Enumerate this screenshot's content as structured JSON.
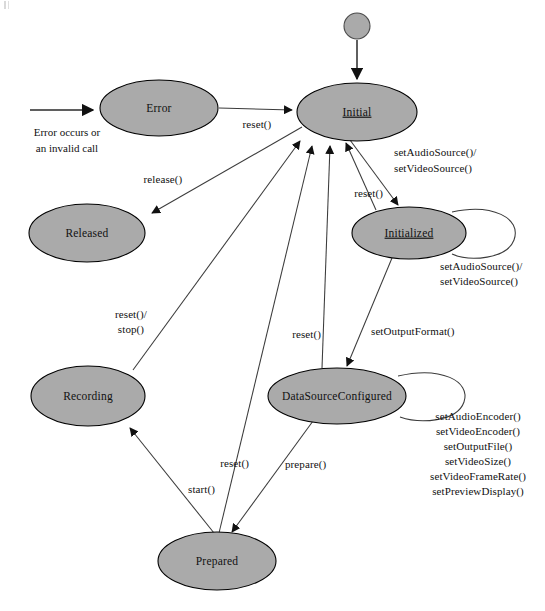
{
  "diagram": {
    "type": "state-machine",
    "colors": {
      "state_fill": "#aaaaaa",
      "state_stroke": "#000000",
      "edge_stroke": "#3b3b3b",
      "background": "#ffffff",
      "text": "#111111"
    },
    "start_node": {
      "name": "initial-pseudostate",
      "cx": 357,
      "cy": 26,
      "r": 13
    },
    "states": [
      {
        "id": "error",
        "label": "Error",
        "cx": 159,
        "cy": 108,
        "rx": 59,
        "ry": 28,
        "underlined": false
      },
      {
        "id": "initial",
        "label": "Initial",
        "cx": 357,
        "cy": 112,
        "rx": 60,
        "ry": 29,
        "underlined": true
      },
      {
        "id": "released",
        "label": "Released",
        "cx": 87,
        "cy": 233,
        "rx": 58,
        "ry": 29,
        "underlined": false
      },
      {
        "id": "initialized",
        "label": "Initialized",
        "cx": 409,
        "cy": 233,
        "rx": 57,
        "ry": 26,
        "underlined": true
      },
      {
        "id": "recording",
        "label": "Recording",
        "cx": 88,
        "cy": 396,
        "rx": 57,
        "ry": 30,
        "underlined": false
      },
      {
        "id": "datasourceconfigured",
        "label": "DataSourceConfigured",
        "cx": 337,
        "cy": 396,
        "rx": 69,
        "ry": 28,
        "underlined": false
      },
      {
        "id": "prepared",
        "label": "Prepared",
        "cx": 217,
        "cy": 561,
        "rx": 59,
        "ry": 29,
        "underlined": false
      }
    ],
    "notes": [
      {
        "id": "error-source-note",
        "lines": [
          "Error occurs or",
          "an invalid call"
        ],
        "x": 67,
        "y": 133
      }
    ],
    "transitions": [
      {
        "id": "t-enter-error",
        "from": "(external)",
        "to": "error",
        "label": ""
      },
      {
        "id": "t-start-initial",
        "from": "initial-pseudostate",
        "to": "initial",
        "label": ""
      },
      {
        "id": "t-error-initial",
        "from": "error",
        "to": "initial",
        "label": "reset()",
        "label_x": 257,
        "label_y": 124
      },
      {
        "id": "t-error-released",
        "from": "error",
        "to": "released",
        "label": "release()",
        "label_x": 163,
        "label_y": 180
      },
      {
        "id": "t-initial-initialized",
        "from": "initial",
        "to": "initialized",
        "label": "setAudioSource()/\nsetVideoSource()",
        "label_x": 396,
        "label_y": 155
      },
      {
        "id": "t-initialized-initial",
        "from": "initialized",
        "to": "initial",
        "label": "reset()",
        "label_x": 350,
        "label_y": 193
      },
      {
        "id": "t-initialized-self",
        "from": "initialized",
        "to": "initialized",
        "label": "setAudioSource()/\nsetVideoSource()",
        "label_x": 443,
        "label_y": 266
      },
      {
        "id": "t-initialized-dsc",
        "from": "initialized",
        "to": "datasourceconfigured",
        "label": "setOutputFormat()",
        "label_x": 372,
        "label_y": 332
      },
      {
        "id": "t-dsc-initial",
        "from": "datasourceconfigured",
        "to": "initial",
        "label": "reset()",
        "label_x": 287,
        "label_y": 335
      },
      {
        "id": "t-dsc-self",
        "from": "datasourceconfigured",
        "to": "datasourceconfigured",
        "label": "setAudioEncoder()\nsetVideoEncoder()\nsetOutputFile()\nsetVideoSize()\nsetVideoFrameRate()\nsetPreviewDisplay()",
        "label_x": 478,
        "label_y": 418
      },
      {
        "id": "t-dsc-prepared",
        "from": "datasourceconfigured",
        "to": "prepared",
        "label": "prepare()",
        "label_x": 289,
        "label_y": 465
      },
      {
        "id": "t-prepared-recording",
        "from": "prepared",
        "to": "recording",
        "label": "start()",
        "label_x": 215,
        "label_y": 490
      },
      {
        "id": "t-prepared-initial",
        "from": "prepared",
        "to": "initial",
        "label": "reset()",
        "label_x": 213,
        "label_y": 464
      },
      {
        "id": "t-recording-initial",
        "from": "recording",
        "to": "initial",
        "label": "reset()/\nstop()",
        "label_x": 131,
        "label_y": 316
      }
    ],
    "method_lists": {
      "source_methods": [
        "setAudioSource()/",
        "setVideoSource()"
      ],
      "encoder_methods": [
        "setAudioEncoder()",
        "setVideoEncoder()",
        "setOutputFile()",
        "setVideoSize()",
        "setVideoFrameRate()",
        "setPreviewDisplay()"
      ]
    }
  }
}
